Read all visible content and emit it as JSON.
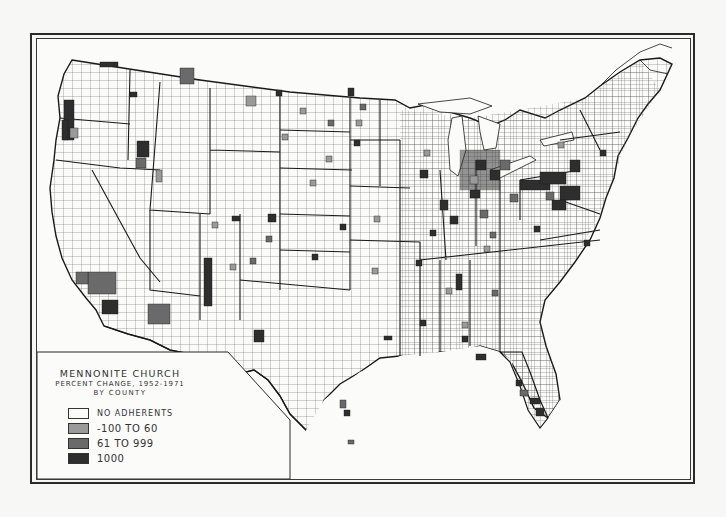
{
  "map": {
    "title": "MENNONITE CHURCH",
    "subtitle": "PERCENT CHANGE, 1952-1971",
    "subtitle2": "BY COUNTY",
    "region": "Contiguous United States, by county",
    "legend": [
      {
        "label": "NO ADHERENTS",
        "color": "#fbfbfa"
      },
      {
        "label": "-100 TO 60",
        "color": "#9a9a9a"
      },
      {
        "label": "61 TO 999",
        "color": "#6a6a6a"
      },
      {
        "label": "1000",
        "color": "#2e2e2e"
      }
    ],
    "colors": {
      "border": "#2a2a2a",
      "background": "#fbfbfa",
      "light_class": "#9a9a9a",
      "mid_class": "#6a6a6a",
      "dark_class": "#2e2e2e"
    },
    "notable_concentrations": [
      "Pennsylvania / Maryland (heavy dark shading)",
      "Ohio / Indiana / Michigan",
      "Western Oregon",
      "Kansas / Nebraska",
      "Southern Florida",
      "Texas Gulf Coast"
    ]
  }
}
